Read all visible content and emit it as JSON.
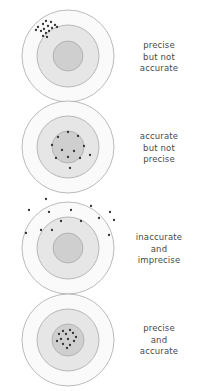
{
  "figure": {
    "background_color": "#ffffff",
    "width": 198,
    "height": 391
  },
  "target_style": {
    "outer_ring_fill": "#fafafa",
    "middle_ring_fill": "#e6e6e6",
    "bullseye_fill": "#cfcfcf",
    "ring_stroke": "#a9a9a9",
    "dot_color": "#333333",
    "dot_radius": 1.15
  },
  "panels": [
    {
      "id": "panel-precise-not-accurate",
      "caption": "precise\nbut not\naccurate",
      "caption_line1": "precise",
      "caption_line2": "but not",
      "caption_line3": "accurate",
      "center_x": 68,
      "center_y": 56,
      "outer_radius": 46,
      "middle_radius": 31,
      "bullseye_radius": 15,
      "bullseye_stippled": false,
      "dot_count": 15,
      "dots": [
        [
          46,
          21
        ],
        [
          51,
          22
        ],
        [
          43,
          24
        ],
        [
          55,
          25
        ],
        [
          48,
          26
        ],
        [
          38,
          27
        ],
        [
          52,
          28
        ],
        [
          44,
          29
        ],
        [
          57,
          27
        ],
        [
          41,
          31
        ],
        [
          49,
          31
        ],
        [
          36,
          30
        ],
        [
          46,
          33
        ],
        [
          43,
          36
        ],
        [
          47,
          37
        ]
      ]
    },
    {
      "id": "panel-accurate-not-precise",
      "caption": "accurate\nbut not\nprecise",
      "caption_line1": "accurate",
      "caption_line2": "but not",
      "caption_line3": "precise",
      "center_x": 68,
      "center_y": 147,
      "outer_radius": 46,
      "middle_radius": 31,
      "bullseye_radius": 16,
      "bullseye_stippled": true,
      "dot_count": 12,
      "dots": [
        [
          68,
          132
        ],
        [
          78,
          136
        ],
        [
          58,
          137
        ],
        [
          84,
          146
        ],
        [
          52,
          145
        ],
        [
          62,
          150
        ],
        [
          74,
          151
        ],
        [
          68,
          157
        ],
        [
          56,
          158
        ],
        [
          80,
          158
        ],
        [
          90,
          155
        ],
        [
          70,
          168
        ]
      ]
    },
    {
      "id": "panel-inaccurate-imprecise",
      "caption": "inaccurate\nand\nimprecise",
      "caption_line1": "inaccurate",
      "caption_line2": "and",
      "caption_line3": "imprecise",
      "center_x": 68,
      "center_y": 248,
      "outer_radius": 46,
      "middle_radius": 31,
      "bullseye_radius": 15,
      "bullseye_stippled": false,
      "dot_count": 14,
      "dots": [
        [
          46,
          199
        ],
        [
          29,
          210
        ],
        [
          49,
          212
        ],
        [
          71,
          210
        ],
        [
          91,
          206
        ],
        [
          110,
          212
        ],
        [
          114,
          220
        ],
        [
          99,
          218
        ],
        [
          61,
          221
        ],
        [
          81,
          221
        ],
        [
          41,
          230
        ],
        [
          52,
          230
        ],
        [
          26,
          233
        ],
        [
          109,
          235
        ]
      ]
    },
    {
      "id": "panel-precise-accurate",
      "caption": "precise\nand\naccurate",
      "caption_line1": "precise",
      "caption_line2": "and",
      "caption_line3": "accurate",
      "center_x": 68,
      "center_y": 340,
      "outer_radius": 46,
      "middle_radius": 31,
      "bullseye_radius": 16,
      "bullseye_stippled": false,
      "dot_count": 13,
      "dots": [
        [
          63,
          331
        ],
        [
          70,
          330
        ],
        [
          59,
          334
        ],
        [
          66,
          334
        ],
        [
          73,
          333
        ],
        [
          76,
          337
        ],
        [
          61,
          339
        ],
        [
          68,
          339
        ],
        [
          74,
          341
        ],
        [
          63,
          344
        ],
        [
          70,
          345
        ],
        [
          57,
          341
        ],
        [
          67,
          348
        ]
      ]
    }
  ],
  "captions": {
    "panel1": "precise\nbut not\naccurate",
    "panel2": "accurate\nbut not\nprecise",
    "panel3": "inaccurate\nand\nimprecise",
    "panel4": "precise\nand\naccurate"
  }
}
